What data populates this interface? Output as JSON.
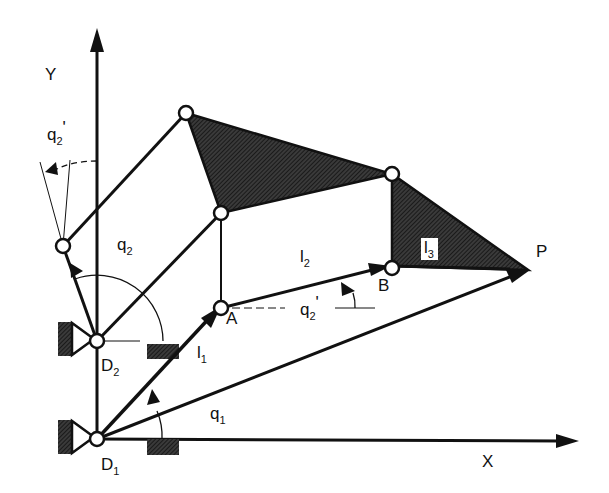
{
  "diagram": {
    "colors": {
      "ink": "#111111",
      "hatch": "#2a2a2a",
      "background": "#ffffff"
    },
    "axes": {
      "x_label": "X",
      "y_label": "Y"
    },
    "points": {
      "D1": {
        "main": "D",
        "sub": "1"
      },
      "D2": {
        "main": "D",
        "sub": "2"
      },
      "A": {
        "main": "A"
      },
      "B": {
        "main": "B"
      },
      "P": {
        "main": "P"
      }
    },
    "links": {
      "l1": {
        "main": "l",
        "sub": "1"
      },
      "l2": {
        "main": "l",
        "sub": "2"
      },
      "l3": {
        "main": "l",
        "sub": "3"
      }
    },
    "angles": {
      "q1": {
        "main": "q",
        "sub": "1"
      },
      "q2": {
        "main": "q",
        "sub": "2"
      },
      "q2_prime_top": {
        "main": "q",
        "sub": "2",
        "prime": "'"
      },
      "q2_prime_mid": {
        "main": "q",
        "sub": "2",
        "prime": "'"
      }
    }
  }
}
